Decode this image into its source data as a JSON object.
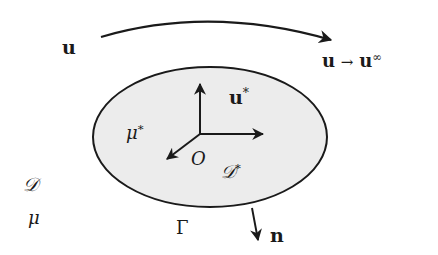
{
  "diagram": {
    "labels": {
      "u_far": "u",
      "u_limit_lhs": "u",
      "u_limit_arrow": "→",
      "u_limit_rhs": "u",
      "u_limit_sup": "∞",
      "u_star": "u",
      "u_star_sup": "*",
      "mu_star": "μ",
      "mu_star_sup": "*",
      "origin": "O",
      "D_star": "𝒟",
      "D_star_sup": "*",
      "D_outer": "𝒟",
      "mu_outer": "μ",
      "gamma": "Γ",
      "normal": "n"
    },
    "colors": {
      "stroke": "#1a1a1a",
      "body_fill": "#ececec",
      "background": "#ffffff"
    }
  }
}
